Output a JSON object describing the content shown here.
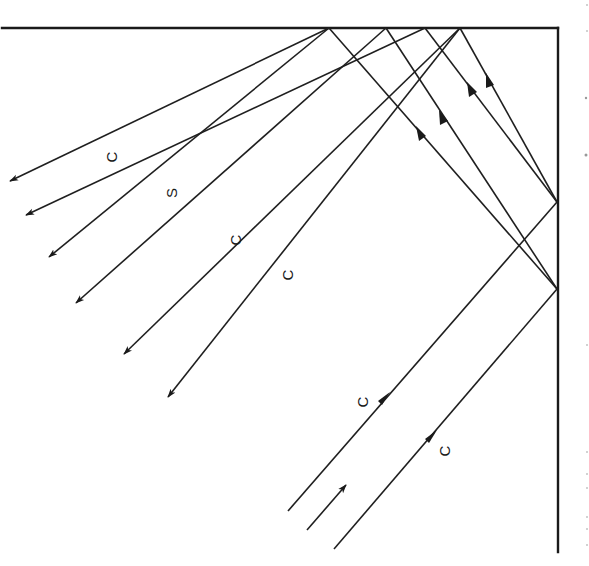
{
  "diagram": {
    "walls": {
      "top": {
        "x1": 2,
        "y1": 28,
        "x2": 558,
        "y2": 28
      },
      "right": {
        "x1": 558,
        "y1": 28,
        "x2": 558,
        "y2": 552
      }
    },
    "reflection_points": {
      "top": [
        [
          329,
          28
        ],
        [
          386,
          28
        ],
        [
          425,
          28
        ],
        [
          460,
          28
        ]
      ],
      "right": [
        [
          557,
          202
        ],
        [
          557,
          289
        ]
      ]
    },
    "incoming_rays": [
      {
        "from": [
          288,
          511
        ],
        "to": [
          557,
          202
        ],
        "label": "C",
        "arrow_at": [
          386,
          398
        ]
      },
      {
        "from": [
          334,
          549
        ],
        "to": [
          557,
          289
        ],
        "label": "C",
        "arrow_at": [
          433,
          436
        ]
      }
    ],
    "direction_indicator": {
      "from": [
        307,
        530
      ],
      "to": [
        347,
        484
      ]
    },
    "reflected_rays_right_to_top": [
      {
        "from": [
          557,
          289
        ],
        "to": [
          329,
          28
        ],
        "arrow_at": [
          421,
          132
        ]
      },
      {
        "from": [
          557,
          289
        ],
        "to": [
          386,
          28
        ],
        "arrow_at": [
          443,
          117
        ]
      },
      {
        "from": [
          557,
          202
        ],
        "to": [
          425,
          28
        ],
        "arrow_at": [
          472,
          88
        ]
      },
      {
        "from": [
          557,
          202
        ],
        "to": [
          460,
          28
        ],
        "arrow_at": [
          490,
          80
        ]
      }
    ],
    "outgoing_rays": [
      {
        "from": [
          329,
          28
        ],
        "to": [
          9,
          182
        ]
      },
      {
        "from": [
          425,
          28
        ],
        "to": [
          25,
          216
        ]
      },
      {
        "from": [
          329,
          28
        ],
        "to": [
          48,
          258
        ]
      },
      {
        "from": [
          386,
          28
        ],
        "to": [
          75,
          304
        ]
      },
      {
        "from": [
          460,
          28
        ],
        "to": [
          123,
          355
        ]
      },
      {
        "from": [
          460,
          28
        ],
        "to": [
          167,
          398
        ]
      }
    ],
    "labels": [
      {
        "text": "C",
        "x": 112,
        "y": 157
      },
      {
        "text": "S",
        "x": 172,
        "y": 193
      },
      {
        "text": "C",
        "x": 236,
        "y": 240
      },
      {
        "text": "C",
        "x": 288,
        "y": 275
      },
      {
        "text": "C",
        "x": 363,
        "y": 402
      },
      {
        "text": "C",
        "x": 445,
        "y": 451
      }
    ],
    "label_rotation_deg": -90
  }
}
